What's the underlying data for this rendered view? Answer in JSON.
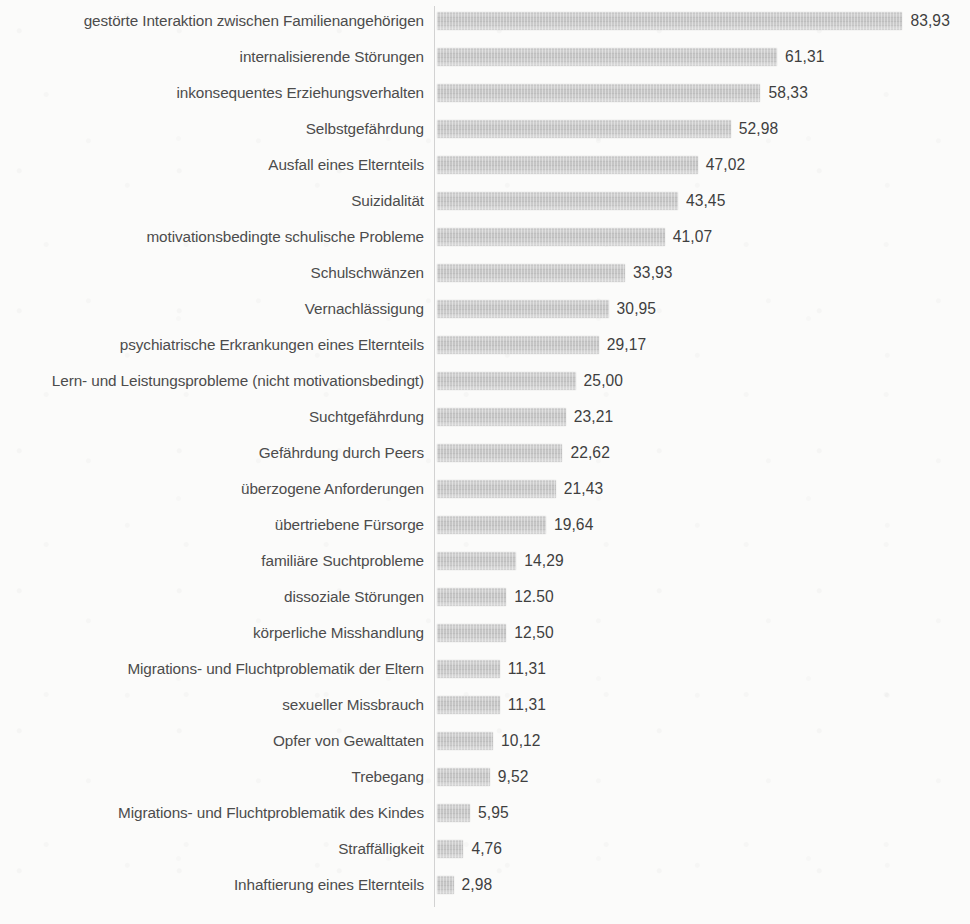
{
  "chart_data": {
    "type": "bar",
    "orientation": "horizontal",
    "title": "",
    "subtitle": "",
    "xlabel": "",
    "ylabel": "",
    "xlim": [
      0,
      83.93
    ],
    "grid": false,
    "legend": null,
    "value_suffix": "",
    "categories": [
      "gestörte Interaktion zwischen Familienangehörigen",
      "internalisierende Störungen",
      "inkonsequentes Erziehungsverhalten",
      "Selbstgefährdung",
      "Ausfall eines Elternteils",
      "Suizidalität",
      "motivationsbedingte schulische Probleme",
      "Schulschwänzen",
      "Vernachlässigung",
      "psychiatrische Erkrankungen eines Elternteils",
      "Lern- und Leistungsprobleme (nicht motivationsbedingt)",
      "Suchtgefährdung",
      "Gefährdung durch Peers",
      "überzogene Anforderungen",
      "übertriebene Fürsorge",
      "familiäre Suchtprobleme",
      "dissoziale Störungen",
      "körperliche Misshandlung",
      "Migrations- und Fluchtproblematik der Eltern",
      "sexueller Missbrauch",
      "Opfer von Gewalttaten",
      "Trebegang",
      "Migrations- und Fluchtproblematik des Kindes",
      "Straffälligkeit",
      "Inhaftierung eines Elternteils"
    ],
    "values": [
      83.93,
      61.31,
      58.33,
      52.98,
      47.02,
      43.45,
      41.07,
      33.93,
      30.95,
      29.17,
      25.0,
      23.21,
      22.62,
      21.43,
      19.64,
      14.29,
      12.5,
      12.5,
      11.31,
      11.31,
      10.12,
      9.52,
      5.95,
      4.76,
      2.98
    ],
    "value_labels": [
      "83,93",
      "61,31",
      "58,33",
      "52,98",
      "47,02",
      "43,45",
      "41,07",
      "33,93",
      "30,95",
      "29,17",
      "25,00",
      "23,21",
      "22,62",
      "21,43",
      "19,64",
      "14,29",
      "12.50",
      "12,50",
      "11,31",
      "11,31",
      "10,12",
      "9,52",
      "5,95",
      "4,76",
      "2,98"
    ],
    "colors": {
      "bar_fill": "#c8c8c8",
      "bar_fill_light": "#d6d6d6",
      "axis_line": "#d2d2d2",
      "label_text": "#4c4c4c",
      "value_text": "#3f3f3f",
      "background": "#fbfbfa"
    }
  }
}
